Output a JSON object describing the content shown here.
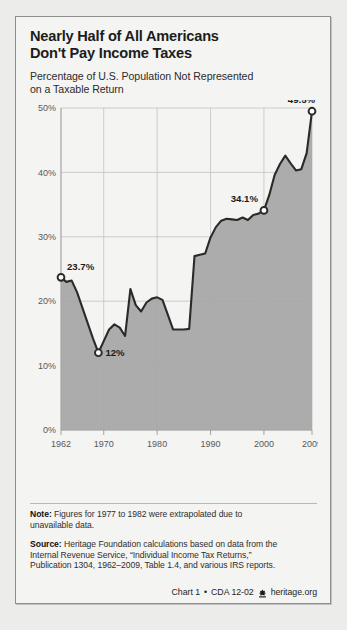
{
  "card": {
    "title_line1": "Nearly Half of All Americans",
    "title_line2": "Don't Pay Income Taxes",
    "subtitle_line1": "Percentage of U.S. Population Not Represented",
    "subtitle_line2": "on a Taxable Return"
  },
  "notes": {
    "note_label": "Note:",
    "note_line1": " Figures for 1977 to 1982 were extrapolated due to",
    "note_line2": "unavailable data.",
    "source_label": "Source:",
    "source_line1": " Heritage Foundation calculations based on data from the",
    "source_line2": "Internal Revenue Service, “Individual Income Tax Returns,”",
    "source_line3": "Publication 1304, 1962–2009, Table 1.4, and various IRS reports."
  },
  "credit": {
    "chart_id": "Chart 1",
    "separator": "•",
    "cda_id": "CDA 12-02",
    "logo_name": "heritage-foundation-mark",
    "site": "heritage.org"
  },
  "colors": {
    "page_bg": "#ededeb",
    "card_bg": "#f4f4f2",
    "card_border": "#8e8e8c",
    "area_fill": "#a8a8a8",
    "line": "#2a2a2a",
    "grid": "#c2c2c0",
    "axis_text": "#58585a"
  },
  "chart_data": {
    "type": "area",
    "title": "Percentage of U.S. Population Not Represented on a Taxable Return",
    "xlabel": "",
    "ylabel": "",
    "xlim": [
      1962,
      2009
    ],
    "ylim": [
      0,
      50
    ],
    "grid": true,
    "legend": "none",
    "y_ticks": [
      0,
      10,
      20,
      30,
      40,
      50
    ],
    "y_tick_labels": [
      "0%",
      "10%",
      "20%",
      "30%",
      "40%",
      "50%"
    ],
    "x_ticks": [
      1962,
      1970,
      1980,
      1990,
      2000,
      2009
    ],
    "x_tick_labels": [
      "1962",
      "1970",
      "1980",
      "1990",
      "2000",
      "2009"
    ],
    "annotations": [
      {
        "label": "23.7%",
        "x": 1962,
        "y": 23.7,
        "marker": true
      },
      {
        "label": "12%",
        "x": 1969,
        "y": 12.0,
        "marker": true
      },
      {
        "label": "34.1%",
        "x": 2000,
        "y": 34.1,
        "marker": true
      },
      {
        "label": "49.5%",
        "x": 2009,
        "y": 49.5,
        "marker": true
      }
    ],
    "x": [
      1962,
      1963,
      1964,
      1965,
      1966,
      1967,
      1968,
      1969,
      1970,
      1971,
      1972,
      1973,
      1974,
      1975,
      1976,
      1977,
      1978,
      1979,
      1980,
      1981,
      1982,
      1983,
      1984,
      1985,
      1986,
      1987,
      1988,
      1989,
      1990,
      1991,
      1992,
      1993,
      1994,
      1995,
      1996,
      1997,
      1998,
      1999,
      2000,
      2001,
      2002,
      2003,
      2004,
      2005,
      2006,
      2007,
      2008,
      2009
    ],
    "values": [
      23.7,
      23.0,
      23.2,
      21.4,
      19.0,
      16.6,
      14.2,
      12.0,
      13.8,
      15.6,
      16.4,
      15.9,
      14.6,
      21.9,
      19.4,
      18.4,
      19.8,
      20.4,
      20.6,
      20.2,
      17.9,
      15.6,
      15.6,
      15.6,
      15.7,
      27.0,
      27.2,
      27.4,
      29.9,
      31.5,
      32.5,
      32.8,
      32.7,
      32.6,
      33.0,
      32.6,
      33.4,
      33.6,
      34.1,
      36.5,
      39.6,
      41.3,
      42.6,
      41.4,
      40.3,
      40.5,
      43.0,
      49.5
    ]
  }
}
